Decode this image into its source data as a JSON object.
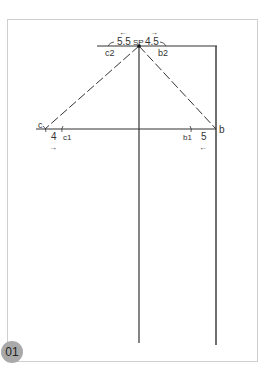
{
  "figure": {
    "badge": "01",
    "labels": {
      "sp": "SP",
      "top_left_measure": "5.5",
      "top_right_measure": "4.5",
      "c2": "c2",
      "b2": "b2",
      "c": "c",
      "c1": "c1",
      "left_measure": "4",
      "b": "b",
      "b1": "b1",
      "right_measure": "5"
    },
    "arrows": {
      "top_left": "←",
      "top_right": "→",
      "bottom_left": "→",
      "bottom_right": "←"
    },
    "colors": {
      "line": "#333333",
      "frame": "#cfcfcf",
      "badge": "#a9a9a9"
    }
  }
}
